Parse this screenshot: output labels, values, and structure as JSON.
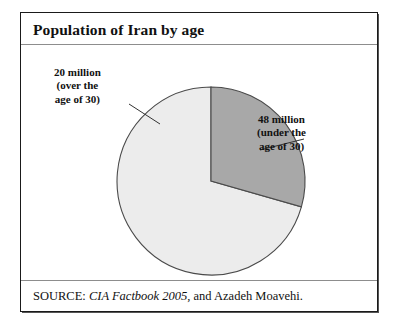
{
  "figure": {
    "title": "Population of Iran by age",
    "source_prefix": "SOURCE:",
    "source_work": "CIA Factbook 2005",
    "source_suffix": ", and Azadeh Moavehi."
  },
  "labels": {
    "over_30": {
      "line1": "20 million",
      "line2": "(over the",
      "line3": "age of 30)"
    },
    "under_30": {
      "line1": "48 million",
      "line2": "(under the",
      "line3": "age of 30)"
    }
  },
  "colors": {
    "slice_over_30": "#a8a8a8",
    "slice_under_30": "#ececec",
    "slice_outline": "#4a4a4a",
    "frame": "#1a1a1a",
    "rule": "#8d8d8d",
    "text": "#111111",
    "leader": "#333333"
  },
  "chart_data": {
    "type": "pie",
    "title": "Population of Iran by age",
    "unit": "million",
    "total": 68,
    "categories": [
      "48 million (under the age of 30)",
      "20 million (over the age of 30)"
    ],
    "values": [
      48,
      20
    ],
    "slices": [
      {
        "label": "48 million (under the age of 30)",
        "short_label": "under the age of 30",
        "value": 48,
        "unit": "million",
        "percent": 70.6,
        "color": "#ececec",
        "start_angle_deg": 0,
        "end_angle_deg": 254
      },
      {
        "label": "20 million (over the age of 30)",
        "short_label": "over the age of 30",
        "value": 20,
        "unit": "million",
        "percent": 29.4,
        "color": "#a8a8a8",
        "start_angle_deg": 254,
        "end_angle_deg": 360
      }
    ],
    "legend": "none",
    "labels_position": "callout-leader-lines",
    "grid": false,
    "xlabel": "",
    "ylabel": ""
  }
}
